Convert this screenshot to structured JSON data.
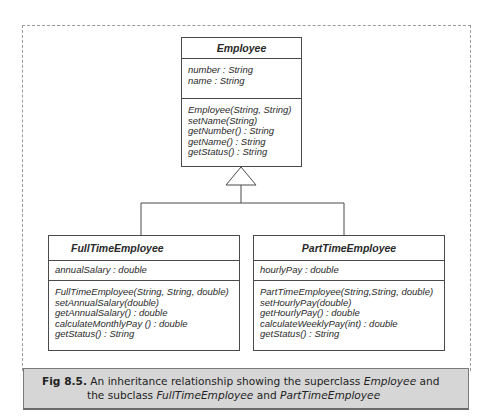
{
  "diagram": {
    "type": "uml-class-inheritance",
    "superclass": {
      "name": "Employee",
      "attributes": [
        "number : String",
        "name : String"
      ],
      "methods": [
        "Employee(String, String)",
        "setName(String)",
        "getNumber() : String",
        "getName() : String",
        "getStatus() : String"
      ]
    },
    "subclasses": [
      {
        "name": "FullTimeEmployee",
        "attributes": [
          "annualSalary : double"
        ],
        "methods": [
          "FullTimeEmployee(String, String, double)",
          "setAnnualSalary(double)",
          "getAnnualSalary() : double",
          "calculateMonthlyPay () : double",
          "getStatus() : String"
        ]
      },
      {
        "name": "PartTimeEmployee",
        "attributes": [
          "hourlyPay : double"
        ],
        "methods": [
          "PartTimeEmployee(String,String, double)",
          "setHourlyPay(double)",
          "getHourlyPay() : double",
          "calculateWeeklyPay(int) : double",
          "getStatus() : String"
        ]
      }
    ],
    "relationship": "generalization"
  },
  "caption": {
    "label": "Fig 8.5.",
    "text_1": " An inheritance relationship showing the superclass ",
    "em_1": "Employee",
    "text_2": " and",
    "text_3": "the subclass ",
    "em_2": "FullTimeEmployee",
    "text_4": " and ",
    "em_3": "PartTimeEmployee"
  },
  "colors": {
    "caption_bg": "#d6d6d6",
    "box_border": "#4a4a4a",
    "frame_border": "#9a9a9a"
  }
}
